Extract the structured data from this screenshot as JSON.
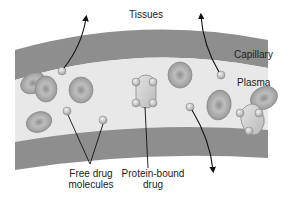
{
  "diagram": {
    "labels": {
      "tissues": "Tissues",
      "capillary": "Capillary",
      "plasma": "Plasma",
      "free_drug_line1": "Free drug",
      "free_drug_line2": "molecules",
      "protein_bound_line1": "Protein-bound",
      "protein_bound_line2": "drug"
    },
    "colors": {
      "vessel_wall": "#8c8c8c",
      "plasma": "#e6e6e6",
      "red_cell": "#a9a9a9",
      "molecule": "#cfcfcf",
      "arrow": "#111111",
      "text": "#222222"
    }
  }
}
